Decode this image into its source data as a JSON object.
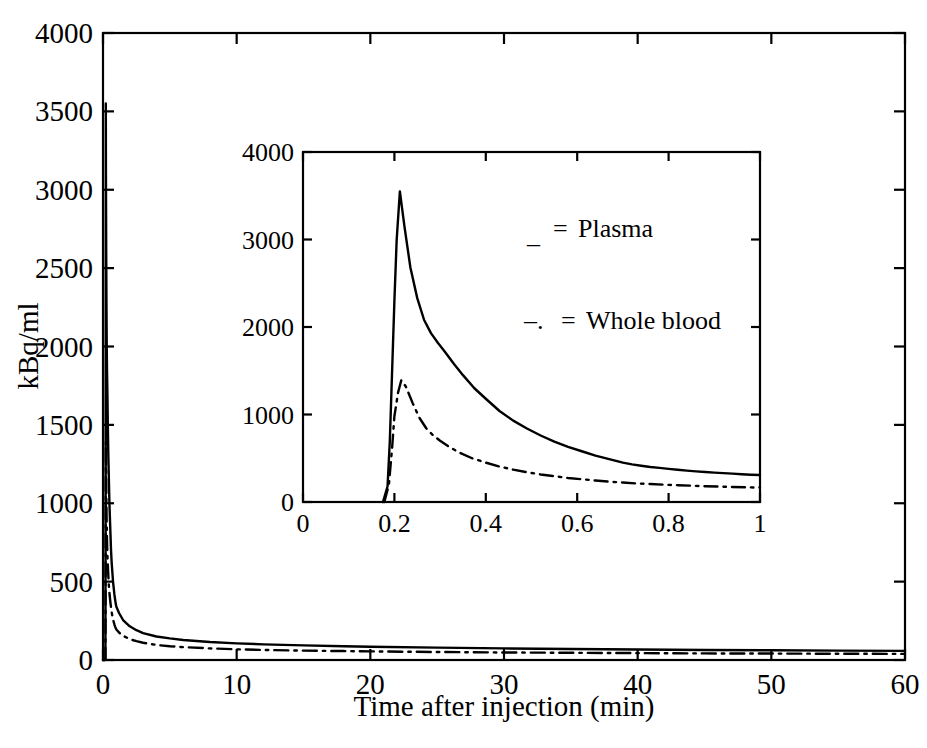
{
  "chart_data": {
    "type": "line",
    "title": "",
    "xlabel": "Time after injection (min)",
    "ylabel": "kBq/ml",
    "xlim": [
      0,
      60
    ],
    "ylim": [
      0,
      4000
    ],
    "xticks": [
      0,
      10,
      20,
      30,
      40,
      50,
      60
    ],
    "xtick_labels": [
      "0",
      "10",
      "20",
      "30",
      "40",
      "50",
      "60"
    ],
    "yticks": [
      0,
      500,
      1000,
      1500,
      2000,
      2500,
      3000,
      3500,
      4000
    ],
    "ytick_labels": [
      "0",
      "500",
      "1000",
      "1500",
      "2000",
      "2500",
      "3000",
      "3500",
      "4000"
    ],
    "grid": false,
    "legend_position": "inset-upper-right",
    "legend": [
      {
        "marker": "_",
        "separator": "=",
        "label": "Plasma",
        "style": "solid"
      },
      {
        "marker": "–.",
        "separator": "=",
        "label": "Whole blood",
        "style": "dashdot"
      }
    ],
    "series": [
      {
        "name": "Plasma",
        "style": "solid",
        "color": "#000000",
        "points": [
          [
            0.0,
            0
          ],
          [
            0.05,
            0
          ],
          [
            0.12,
            0
          ],
          [
            0.18,
            10
          ],
          [
            0.19,
            600
          ],
          [
            0.2,
            1800
          ],
          [
            0.205,
            2700
          ],
          [
            0.21,
            3550
          ],
          [
            0.22,
            3100
          ],
          [
            0.24,
            2600
          ],
          [
            0.26,
            2250
          ],
          [
            0.28,
            2000
          ],
          [
            0.3,
            1850
          ],
          [
            0.33,
            1700
          ],
          [
            0.36,
            1500
          ],
          [
            0.4,
            1300
          ],
          [
            0.44,
            1150
          ],
          [
            0.48,
            1000
          ],
          [
            0.52,
            900
          ],
          [
            0.56,
            800
          ],
          [
            0.6,
            700
          ],
          [
            0.65,
            620
          ],
          [
            0.7,
            560
          ],
          [
            0.75,
            500
          ],
          [
            0.8,
            460
          ],
          [
            0.85,
            420
          ],
          [
            0.9,
            390
          ],
          [
            0.95,
            360
          ],
          [
            1.0,
            340
          ],
          [
            1.2,
            300
          ],
          [
            1.5,
            255
          ],
          [
            2.0,
            215
          ],
          [
            2.5,
            190
          ],
          [
            3.0,
            172
          ],
          [
            4.0,
            150
          ],
          [
            5.0,
            138
          ],
          [
            6.0,
            128
          ],
          [
            8.0,
            115
          ],
          [
            10.0,
            106
          ],
          [
            12.0,
            100
          ],
          [
            15.0,
            93
          ],
          [
            18.0,
            88
          ],
          [
            20.0,
            85
          ],
          [
            25.0,
            79
          ],
          [
            30.0,
            74
          ],
          [
            35.0,
            70
          ],
          [
            40.0,
            67
          ],
          [
            45.0,
            64
          ],
          [
            50.0,
            62
          ],
          [
            55.0,
            60
          ],
          [
            60.0,
            58
          ]
        ]
      },
      {
        "name": "Whole blood",
        "style": "dashdot",
        "color": "#000000",
        "points": [
          [
            0.0,
            0
          ],
          [
            0.05,
            0
          ],
          [
            0.12,
            0
          ],
          [
            0.18,
            10
          ],
          [
            0.19,
            300
          ],
          [
            0.2,
            800
          ],
          [
            0.21,
            1150
          ],
          [
            0.215,
            1390
          ],
          [
            0.23,
            1250
          ],
          [
            0.25,
            1050
          ],
          [
            0.27,
            900
          ],
          [
            0.29,
            800
          ],
          [
            0.31,
            730
          ],
          [
            0.34,
            650
          ],
          [
            0.38,
            570
          ],
          [
            0.42,
            500
          ],
          [
            0.46,
            450
          ],
          [
            0.5,
            410
          ],
          [
            0.55,
            370
          ],
          [
            0.6,
            335
          ],
          [
            0.65,
            305
          ],
          [
            0.7,
            280
          ],
          [
            0.75,
            260
          ],
          [
            0.8,
            243
          ],
          [
            0.85,
            228
          ],
          [
            0.9,
            215
          ],
          [
            0.95,
            203
          ],
          [
            1.0,
            195
          ],
          [
            1.2,
            175
          ],
          [
            1.5,
            155
          ],
          [
            2.0,
            133
          ],
          [
            2.5,
            120
          ],
          [
            3.0,
            110
          ],
          [
            4.0,
            96
          ],
          [
            5.0,
            88
          ],
          [
            6.0,
            82
          ],
          [
            8.0,
            74
          ],
          [
            10.0,
            68
          ],
          [
            12.0,
            64
          ],
          [
            15.0,
            60
          ],
          [
            18.0,
            57
          ],
          [
            20.0,
            55
          ],
          [
            25.0,
            51
          ],
          [
            30.0,
            48
          ],
          [
            35.0,
            46
          ],
          [
            40.0,
            44
          ],
          [
            45.0,
            42
          ],
          [
            50.0,
            41
          ],
          [
            55.0,
            40
          ],
          [
            60.0,
            39
          ]
        ]
      }
    ],
    "inset": {
      "type": "line",
      "xlim": [
        0,
        1
      ],
      "ylim": [
        0,
        4000
      ],
      "xticks": [
        0,
        0.2,
        0.4,
        0.6,
        0.8,
        1
      ],
      "xtick_labels": [
        "0",
        "0.2",
        "0.4",
        "0.6",
        "0.8",
        "1"
      ],
      "yticks": [
        0,
        1000,
        2000,
        3000,
        4000
      ],
      "ytick_labels": [
        "0",
        "1000",
        "2000",
        "3000",
        "4000"
      ],
      "grid": false,
      "series": [
        {
          "name": "Plasma",
          "style": "solid",
          "points": [
            [
              0.175,
              0
            ],
            [
              0.185,
              180
            ],
            [
              0.19,
              700
            ],
            [
              0.195,
              1500
            ],
            [
              0.2,
              2300
            ],
            [
              0.205,
              3000
            ],
            [
              0.212,
              3550
            ],
            [
              0.222,
              3150
            ],
            [
              0.235,
              2680
            ],
            [
              0.25,
              2330
            ],
            [
              0.265,
              2080
            ],
            [
              0.28,
              1930
            ],
            [
              0.295,
              1820
            ],
            [
              0.31,
              1720
            ],
            [
              0.33,
              1580
            ],
            [
              0.35,
              1450
            ],
            [
              0.375,
              1300
            ],
            [
              0.4,
              1180
            ],
            [
              0.43,
              1040
            ],
            [
              0.46,
              930
            ],
            [
              0.49,
              840
            ],
            [
              0.52,
              760
            ],
            [
              0.55,
              690
            ],
            [
              0.58,
              630
            ],
            [
              0.61,
              580
            ],
            [
              0.64,
              530
            ],
            [
              0.67,
              490
            ],
            [
              0.7,
              450
            ],
            [
              0.72,
              430
            ],
            [
              0.74,
              415
            ],
            [
              0.76,
              400
            ],
            [
              0.78,
              390
            ],
            [
              0.8,
              378
            ],
            [
              0.82,
              368
            ],
            [
              0.84,
              358
            ],
            [
              0.86,
              350
            ],
            [
              0.88,
              342
            ],
            [
              0.9,
              336
            ],
            [
              0.92,
              330
            ],
            [
              0.94,
              324
            ],
            [
              0.96,
              318
            ],
            [
              0.98,
              312
            ],
            [
              1.0,
              308
            ]
          ]
        },
        {
          "name": "Whole blood",
          "style": "dashdot",
          "points": [
            [
              0.178,
              0
            ],
            [
              0.188,
              200
            ],
            [
              0.195,
              620
            ],
            [
              0.2,
              980
            ],
            [
              0.208,
              1250
            ],
            [
              0.215,
              1390
            ],
            [
              0.225,
              1320
            ],
            [
              0.24,
              1130
            ],
            [
              0.255,
              960
            ],
            [
              0.27,
              840
            ],
            [
              0.285,
              760
            ],
            [
              0.3,
              700
            ],
            [
              0.32,
              630
            ],
            [
              0.34,
              570
            ],
            [
              0.37,
              500
            ],
            [
              0.4,
              450
            ],
            [
              0.43,
              405
            ],
            [
              0.46,
              370
            ],
            [
              0.49,
              340
            ],
            [
              0.52,
              315
            ],
            [
              0.55,
              295
            ],
            [
              0.58,
              275
            ],
            [
              0.61,
              260
            ],
            [
              0.64,
              245
            ],
            [
              0.67,
              232
            ],
            [
              0.7,
              222
            ],
            [
              0.73,
              212
            ],
            [
              0.76,
              205
            ],
            [
              0.79,
              198
            ],
            [
              0.82,
              192
            ],
            [
              0.85,
              186
            ],
            [
              0.88,
              180
            ],
            [
              0.91,
              176
            ],
            [
              0.94,
              172
            ],
            [
              0.97,
              168
            ],
            [
              1.0,
              165
            ]
          ]
        }
      ]
    }
  },
  "axes": {
    "main": {
      "x_title": "Time after injection (min)",
      "y_title": "kBq/ml"
    }
  }
}
